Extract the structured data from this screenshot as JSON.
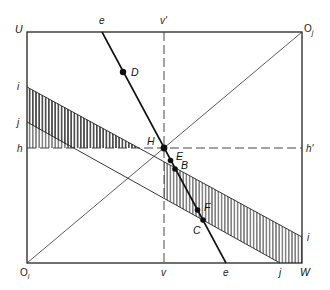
{
  "diagram": {
    "type": "box-diagram",
    "corners": {
      "top_left": "U",
      "top_right": {
        "base": "O",
        "sub": "j"
      },
      "bottom_left": {
        "base": "O",
        "sub": "i"
      },
      "bottom_right": "W"
    },
    "axis_labels": {
      "e_top": "e",
      "e_bottom": "e",
      "v_top": "v'",
      "v_bottom": "v",
      "h_left": "h",
      "h_right": "h'",
      "i_left": "i",
      "i_right": "i",
      "j_left": "j",
      "j_bottom": "j"
    },
    "points": [
      {
        "id": "D",
        "label": "D"
      },
      {
        "id": "H",
        "label": "H"
      },
      {
        "id": "E",
        "label": "E"
      },
      {
        "id": "B",
        "label": "B"
      },
      {
        "id": "F",
        "label": "F"
      },
      {
        "id": "C",
        "label": "C"
      }
    ],
    "lines": [
      {
        "id": "e-line",
        "style": "solid-thick"
      },
      {
        "id": "v-line",
        "style": "dashed"
      },
      {
        "id": "h-line",
        "style": "dashed"
      },
      {
        "id": "i-line",
        "style": "solid"
      },
      {
        "id": "j-line",
        "style": "solid"
      },
      {
        "id": "diagonal",
        "style": "solid",
        "from": "O_i",
        "to": "O_j"
      }
    ],
    "hatched_region": "between i-line and j-line"
  }
}
